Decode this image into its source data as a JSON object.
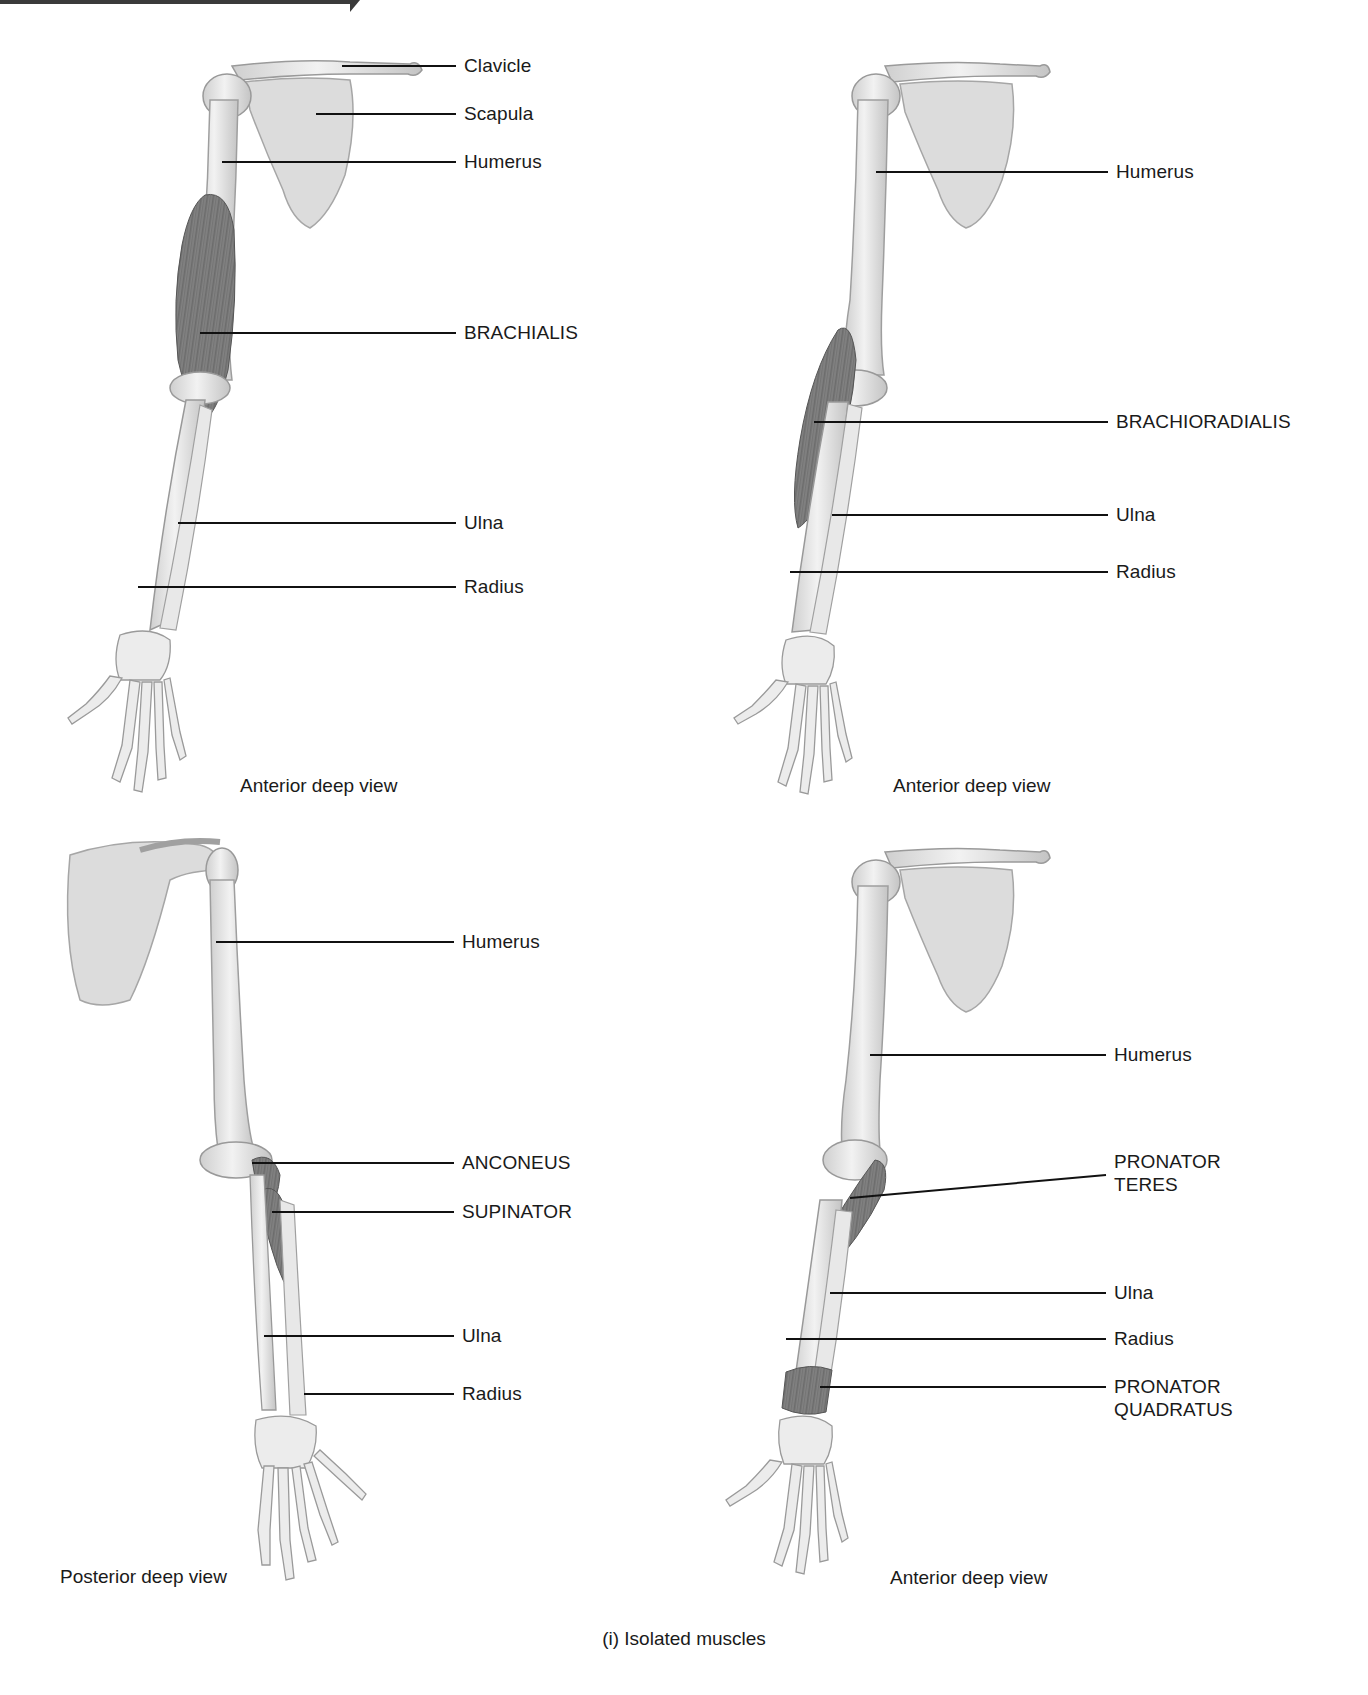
{
  "figure": {
    "caption": "(i) Isolated muscles",
    "colors": {
      "bone": "#e6e6e6",
      "bone_outline": "#a8a8a8",
      "muscle": "#6d6d6d",
      "leader": "#111111",
      "text": "#1a1a1a"
    }
  },
  "panels": [
    {
      "id": "top-left",
      "view": "Anterior deep view",
      "labels": [
        {
          "text": "Clavicle",
          "type": "bone"
        },
        {
          "text": "Scapula",
          "type": "bone"
        },
        {
          "text": "Humerus",
          "type": "bone"
        },
        {
          "text": "BRACHIALIS",
          "type": "muscle"
        },
        {
          "text": "Ulna",
          "type": "bone"
        },
        {
          "text": "Radius",
          "type": "bone"
        }
      ]
    },
    {
      "id": "top-right",
      "view": "Anterior deep view",
      "labels": [
        {
          "text": "Humerus",
          "type": "bone"
        },
        {
          "text": "BRACHIORADIALIS",
          "type": "muscle"
        },
        {
          "text": "Ulna",
          "type": "bone"
        },
        {
          "text": "Radius",
          "type": "bone"
        }
      ]
    },
    {
      "id": "bottom-left",
      "view": "Posterior deep view",
      "labels": [
        {
          "text": "Humerus",
          "type": "bone"
        },
        {
          "text": "ANCONEUS",
          "type": "muscle"
        },
        {
          "text": "SUPINATOR",
          "type": "muscle"
        },
        {
          "text": "Ulna",
          "type": "bone"
        },
        {
          "text": "Radius",
          "type": "bone"
        }
      ]
    },
    {
      "id": "bottom-right",
      "view": "Anterior deep view",
      "labels": [
        {
          "text": "Humerus",
          "type": "bone"
        },
        {
          "text": "PRONATOR",
          "line2": "TERES",
          "type": "muscle"
        },
        {
          "text": "Ulna",
          "type": "bone"
        },
        {
          "text": "Radius",
          "type": "bone"
        },
        {
          "text": "PRONATOR",
          "line2": "QUADRATUS",
          "type": "muscle"
        }
      ]
    }
  ]
}
